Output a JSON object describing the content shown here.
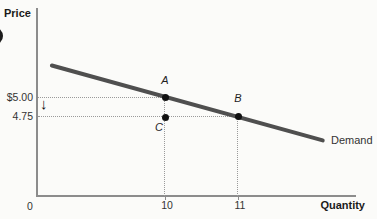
{
  "chart_data": {
    "type": "line",
    "xlabel": "Quantity",
    "ylabel": "Price",
    "x_ticks": [
      "0",
      "10",
      "11"
    ],
    "y_ticks": [
      "$5.00",
      "4.75"
    ],
    "series": [
      {
        "name": "Demand",
        "x": [
          10,
          11
        ],
        "y": [
          5.0,
          4.75
        ]
      }
    ],
    "points": [
      {
        "label": "A",
        "x": 10,
        "y": 5.0,
        "on_curve": true
      },
      {
        "label": "B",
        "x": 11,
        "y": 4.75,
        "on_curve": true
      },
      {
        "label": "C",
        "x": 10,
        "y": 4.75,
        "on_curve": false
      }
    ],
    "annotations": [
      {
        "glyph": "↓",
        "meaning": "price falls from $5.00 to 4.75",
        "location": "y-axis between $5.00 and 4.75"
      }
    ],
    "grid": "off",
    "guides": "dotted reference lines from axes to points A, B, C"
  },
  "ui": {
    "down_arrow_glyph": "↓"
  },
  "colors": {
    "demand_line": "#4f4f4f",
    "axis": "#8c8c8c",
    "point": "#111111",
    "dotted_guide": "#9a9a9a",
    "text": "#2b2b2b",
    "background": "#fbfbf9"
  }
}
